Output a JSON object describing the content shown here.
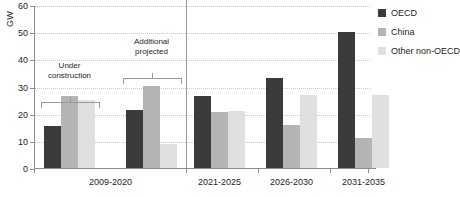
{
  "chart_data": {
    "type": "bar",
    "title": "",
    "xlabel": "",
    "ylabel": "GW",
    "ylim": [
      0,
      60
    ],
    "yticks": [
      0,
      10,
      20,
      30,
      40,
      50,
      60
    ],
    "grid": true,
    "legend_position": "right",
    "categories": [
      "2009-2020 (Under construction)",
      "2009-2020 (Additional projected)",
      "2021-2025",
      "2026-2030",
      "2031-2035"
    ],
    "group_labels": [
      "2009-2020",
      "2021-2025",
      "2026-2030",
      "2031-2035"
    ],
    "series": [
      {
        "name": "OECD",
        "color": "#3b3b3b",
        "values": [
          15.5,
          21.5,
          26.5,
          33.0,
          50.0
        ]
      },
      {
        "name": "China",
        "color": "#b4b4b4",
        "values": [
          26.5,
          30.3,
          20.5,
          16.0,
          11.0
        ]
      },
      {
        "name": "Other non-OECD",
        "color": "#e0e0e0",
        "values": [
          25.0,
          9.0,
          21.0,
          27.0,
          27.0
        ]
      }
    ],
    "annotations": [
      {
        "text": "Under\nconstruction",
        "bracket_over": "2009-2020 (Under construction)"
      },
      {
        "text": "Additional\nprojected",
        "bracket_over": "2009-2020 (Additional projected)"
      }
    ]
  },
  "legend": {
    "items": [
      {
        "label": "OECD"
      },
      {
        "label": "China"
      },
      {
        "label": "Other non-OECD"
      }
    ]
  },
  "axis": {
    "y_title": "GW",
    "y_ticks": [
      "0",
      "10",
      "20",
      "30",
      "40",
      "50",
      "60"
    ],
    "x_labels": [
      "2009-2020",
      "2021-2025",
      "2026-2030",
      "2031-2035"
    ]
  },
  "annotations": {
    "under_construction": "Under\nconstruction",
    "additional_projected": "Additional\nprojected"
  }
}
